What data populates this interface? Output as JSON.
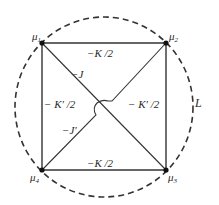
{
  "diagram": {
    "type": "interaction-graph",
    "colors": {
      "stroke": "#333333",
      "text": "#2a2a2a",
      "node": "#111111",
      "background": "#ffffff"
    },
    "nodes": [
      {
        "id": "mu1",
        "label": "μ",
        "sub": "1",
        "x": 42,
        "y": 43
      },
      {
        "id": "mu2",
        "label": "μ",
        "sub": "2",
        "x": 166,
        "y": 43
      },
      {
        "id": "mu3",
        "label": "μ",
        "sub": "3",
        "x": 166,
        "y": 170
      },
      {
        "id": "mu4",
        "label": "μ",
        "sub": "4",
        "x": 42,
        "y": 170
      }
    ],
    "edges": {
      "top": {
        "from": "mu1",
        "to": "mu2",
        "label": "−K /2"
      },
      "bottom": {
        "from": "mu4",
        "to": "mu3",
        "label": "−K /2"
      },
      "left": {
        "from": "mu1",
        "to": "mu4",
        "label": "− K′ /2"
      },
      "right": {
        "from": "mu2",
        "to": "mu3",
        "label": "− K′ /2"
      },
      "diag_main": {
        "from": "mu1",
        "to": "mu3",
        "label": "−J"
      },
      "diag_anti": {
        "from": "mu4",
        "to": "mu2",
        "label": "−J′"
      }
    },
    "loop": {
      "label": "L",
      "style": "dashed"
    }
  }
}
